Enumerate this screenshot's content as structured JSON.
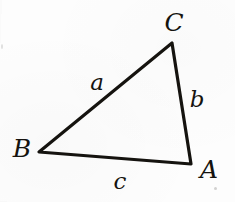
{
  "figure": {
    "kind": "geometry-diagram",
    "background_color": "#fdfdfd",
    "ink_color": "#15130f",
    "stroke_width_px": 3.2,
    "vertices": [
      {
        "name": "A",
        "label": "A",
        "x": 191,
        "y": 164,
        "label_x": 209,
        "label_y": 169
      },
      {
        "name": "B",
        "label": "B",
        "x": 39,
        "y": 152,
        "label_x": 22,
        "label_y": 148
      },
      {
        "name": "C",
        "label": "C",
        "x": 172,
        "y": 43,
        "label_x": 174,
        "label_y": 22
      }
    ],
    "sides": [
      {
        "name": "a",
        "label": "a",
        "from": "B",
        "to": "C",
        "label_x": 97,
        "label_y": 82
      },
      {
        "name": "b",
        "label": "b",
        "from": "C",
        "to": "A",
        "label_x": 197,
        "label_y": 99
      },
      {
        "name": "c",
        "label": "c",
        "from": "B",
        "to": "A",
        "label_x": 120,
        "label_y": 181
      }
    ],
    "polygon_points": "39,152 172,43 191,164",
    "specks": [
      {
        "name": "speck-right",
        "x": 214,
        "y": 187
      },
      {
        "name": "speck-left",
        "x": 1,
        "y": 44
      }
    ]
  }
}
